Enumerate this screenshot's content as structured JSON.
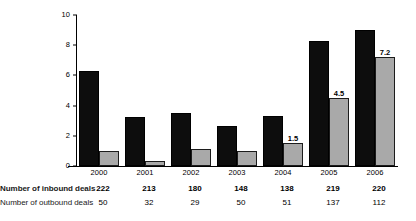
{
  "chart_data": {
    "type": "bar",
    "title": "",
    "xlabel": "",
    "ylabel": "",
    "ylim": [
      0,
      10
    ],
    "yticks": [
      "0",
      "2",
      "4",
      "6",
      "8",
      "10"
    ],
    "grid": false,
    "legend_position": "none",
    "categories": [
      "2000",
      "2001",
      "2002",
      "2003",
      "2004",
      "2005",
      "2006"
    ],
    "series": [
      {
        "name": "Number of inbound deals",
        "color": "#0d0d0d",
        "values": [
          6.3,
          3.25,
          3.5,
          2.65,
          3.3,
          8.3,
          9.0
        ],
        "labels": [
          "",
          "",
          "",
          "",
          "",
          "",
          ""
        ]
      },
      {
        "name": "Number of outbound deals",
        "color": "#a9a9a9",
        "values": [
          1.0,
          0.35,
          1.15,
          1.0,
          1.5,
          4.5,
          7.2
        ],
        "labels": [
          "",
          "",
          "",
          "",
          "1.5",
          "4.5",
          "7.2"
        ]
      }
    ]
  },
  "table": {
    "rows": [
      {
        "label": "Number of inbound deals",
        "bold": true,
        "values": [
          "222",
          "213",
          "180",
          "148",
          "138",
          "219",
          "220"
        ]
      },
      {
        "label": "Number of outbound deals",
        "bold": false,
        "values": [
          "50",
          "32",
          "29",
          "50",
          "51",
          "137",
          "112"
        ]
      }
    ]
  }
}
